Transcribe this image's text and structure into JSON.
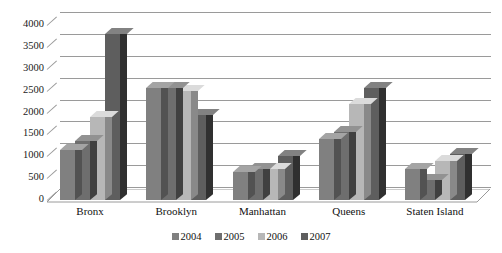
{
  "chart_data": {
    "type": "bar",
    "title": "",
    "subtitle": "",
    "xlabel": "",
    "ylabel": "",
    "categories": [
      "Bronx",
      "Brooklyn",
      "Manhattan",
      "Queens",
      "Staten Island"
    ],
    "series": [
      {
        "name": "2004",
        "color": "#808080",
        "values": [
          1150,
          2550,
          650,
          1400,
          700
        ]
      },
      {
        "name": "2005",
        "color": "#6e6e6e",
        "values": [
          1350,
          2550,
          700,
          1550,
          450
        ]
      },
      {
        "name": "2006",
        "color": "#b7b7b7",
        "values": [
          1900,
          2500,
          700,
          2200,
          900
        ]
      },
      {
        "name": "2007",
        "color": "#5e5e5e",
        "values": [
          3800,
          1950,
          1000,
          2550,
          1050
        ]
      }
    ],
    "ylim": [
      0,
      4000
    ],
    "ytick_step": 500,
    "yticks": [
      "0",
      "500",
      "1000",
      "1500",
      "2000",
      "2500",
      "3000",
      "3500",
      "4000"
    ],
    "grid": true,
    "grid_color": "#9a9a9a",
    "legend_position": "bottom",
    "three_d": true,
    "background_color": "#ffffff"
  },
  "legend": {
    "entries": [
      {
        "label": "2004"
      },
      {
        "label": "2005"
      },
      {
        "label": "2006"
      },
      {
        "label": "2007"
      }
    ]
  }
}
